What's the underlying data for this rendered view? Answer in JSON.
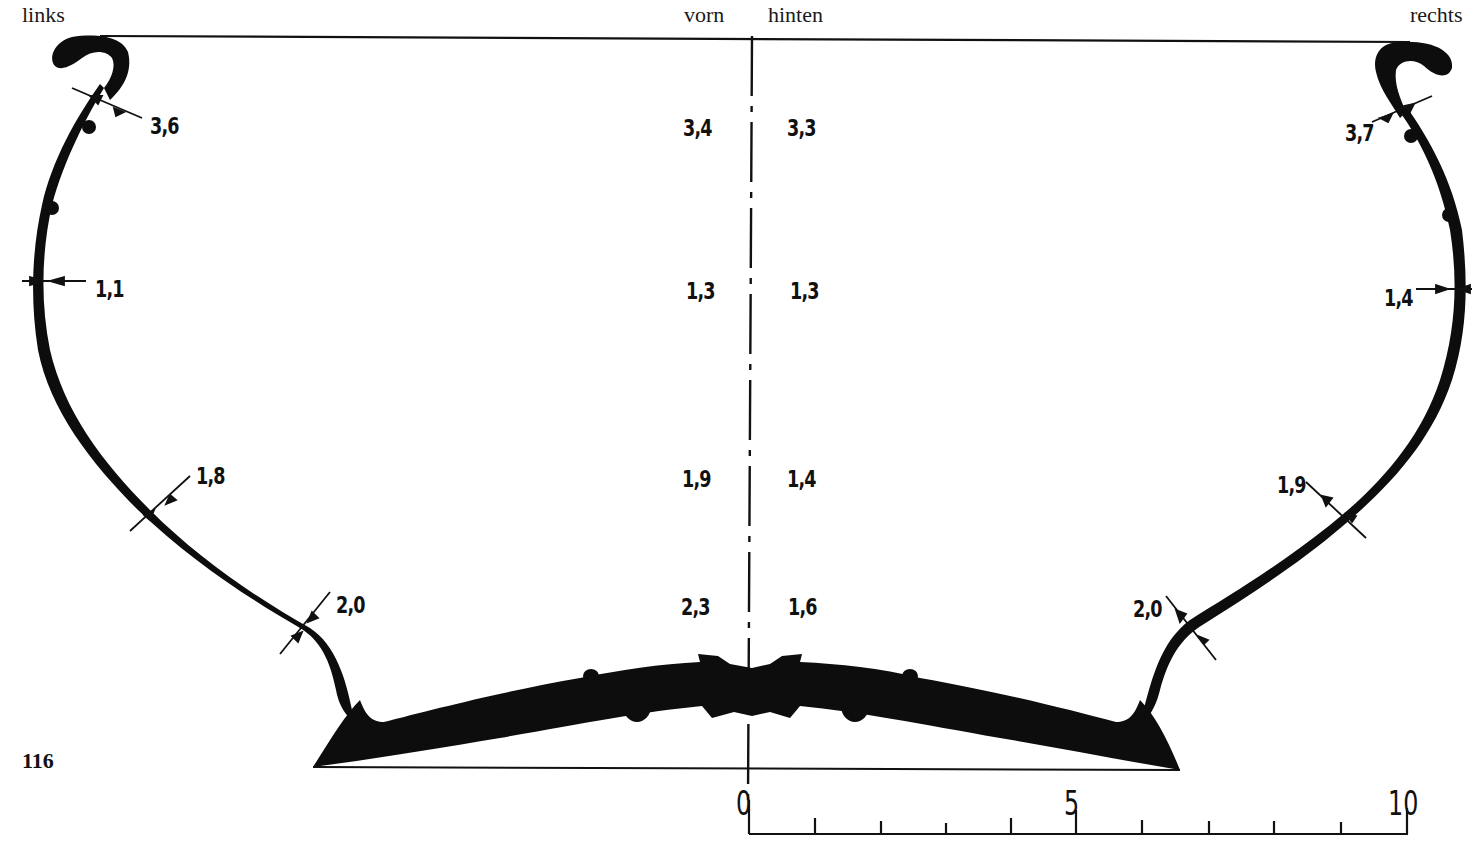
{
  "figure": {
    "number": "116",
    "orientation_labels": {
      "left": "links",
      "front": "vorn",
      "back": "hinten",
      "right": "rechts"
    },
    "ink_color": "#0d0d0d",
    "background": "#ffffff"
  },
  "measurements": {
    "left_wall": [
      {
        "id": "rim",
        "value": "3,6"
      },
      {
        "id": "upper",
        "value": "1,1"
      },
      {
        "id": "middle",
        "value": "1,8"
      },
      {
        "id": "lower",
        "value": "2,0"
      }
    ],
    "center_front": [
      {
        "id": "rim",
        "value": "3,4"
      },
      {
        "id": "upper",
        "value": "1,3"
      },
      {
        "id": "middle",
        "value": "1,9"
      },
      {
        "id": "lower",
        "value": "2,3"
      }
    ],
    "center_back": [
      {
        "id": "rim",
        "value": "3,3"
      },
      {
        "id": "upper",
        "value": "1,3"
      },
      {
        "id": "middle",
        "value": "1,4"
      },
      {
        "id": "lower",
        "value": "1,6"
      }
    ],
    "right_wall": [
      {
        "id": "rim",
        "value": "3,7"
      },
      {
        "id": "upper",
        "value": "1,4"
      },
      {
        "id": "middle",
        "value": "1,9"
      },
      {
        "id": "lower",
        "value": "2,0"
      }
    ]
  },
  "scale_bar": {
    "labels": [
      "0",
      "5",
      "10"
    ],
    "ticks": 11,
    "unit_span": 10
  }
}
